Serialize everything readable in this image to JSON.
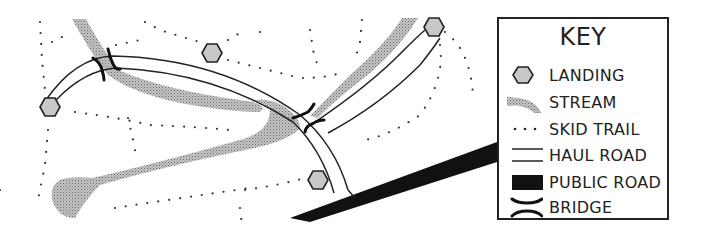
{
  "key": {
    "title": "KEY",
    "items": [
      {
        "symbol": "hexagon-icon",
        "label": "LANDING"
      },
      {
        "symbol": "stream-icon",
        "label": "STREAM"
      },
      {
        "symbol": "dotted-line-icon",
        "label": "SKID TRAIL"
      },
      {
        "symbol": "double-line-icon",
        "label": "HAUL ROAD"
      },
      {
        "symbol": "black-bar-icon",
        "label": "PUBLIC ROAD"
      },
      {
        "symbol": "bridge-icon",
        "label": "BRIDGE"
      }
    ]
  },
  "colors": {
    "ink": "#222222",
    "stream_fill": "#a8a8a8",
    "landing_fill": "#c8c8c8",
    "public_road": "#111111",
    "background": "#ffffff"
  },
  "map": {
    "landings": [
      {
        "x": 50,
        "y": 107
      },
      {
        "x": 212,
        "y": 53
      },
      {
        "x": 434,
        "y": 27
      },
      {
        "x": 318,
        "y": 180
      }
    ],
    "bridges": [
      {
        "x": 107,
        "y": 65
      },
      {
        "x": 307,
        "y": 122
      }
    ]
  }
}
